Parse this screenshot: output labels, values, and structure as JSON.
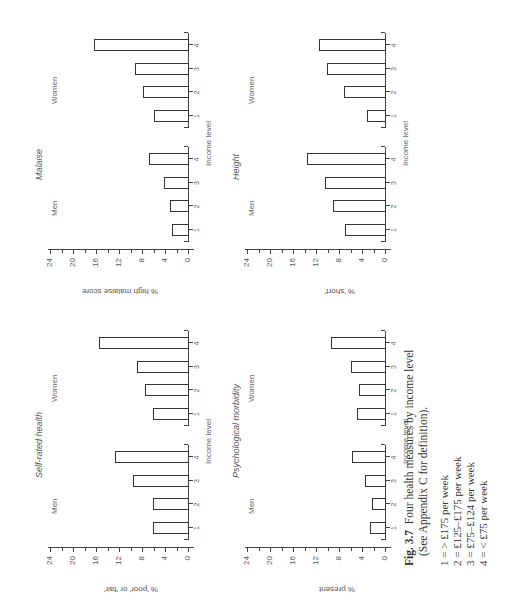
{
  "figure": {
    "label": "Fig. 3.7",
    "title": "Four health measures by income level",
    "subtitle": "(See Appendix C for definition).",
    "legend": [
      "1 = > £175 per week",
      "2 = £125–£175 per week",
      "3 = £75–£124 per week",
      "4 = < £75 per week"
    ]
  },
  "axis": {
    "ticks": [
      "0",
      "4",
      "8",
      "12",
      "16",
      "20",
      "24"
    ],
    "categories": [
      "1",
      "2",
      "3",
      "4"
    ],
    "xlabel": "Income level",
    "men_label": "Men",
    "women_label": "Women"
  },
  "panels": {
    "self_rated": {
      "title": "Self-rated health",
      "ylabel": "% 'poor' or 'fair'"
    },
    "malaise": {
      "title": "Malaise",
      "ylabel": "% high malaise score"
    },
    "psych": {
      "title": "Psychological morbidity",
      "ylabel": "% present"
    },
    "height": {
      "title": "Height",
      "ylabel": "% 'short'"
    }
  },
  "chart_data": [
    {
      "type": "bar",
      "title": "Self-rated health",
      "xlabel": "Income level",
      "ylabel": "% 'poor' or 'fair'",
      "ylim": [
        0,
        24
      ],
      "categories": [
        "1",
        "2",
        "3",
        "4"
      ],
      "series": [
        {
          "name": "Men",
          "values": [
            6.1,
            6.1,
            9.5,
            12.7
          ]
        },
        {
          "name": "Women",
          "values": [
            6.1,
            7.5,
            8.9,
            15.4
          ]
        }
      ]
    },
    {
      "type": "bar",
      "title": "Malaise",
      "xlabel": "Income level",
      "ylabel": "% high malaise score",
      "ylim": [
        0,
        24
      ],
      "categories": [
        "1",
        "2",
        "3",
        "4"
      ],
      "series": [
        {
          "name": "Men",
          "values": [
            2.8,
            3.2,
            4.1,
            6.7
          ]
        },
        {
          "name": "Women",
          "values": [
            6.0,
            7.9,
            9.2,
            16.4
          ]
        }
      ]
    },
    {
      "type": "bar",
      "title": "Psychological morbidity",
      "xlabel": "Income level",
      "ylabel": "% present",
      "ylim": [
        0,
        24
      ],
      "categories": [
        "1",
        "2",
        "3",
        "4"
      ],
      "series": [
        {
          "name": "Men",
          "values": [
            2.6,
            2.2,
            3.4,
            5.8
          ]
        },
        {
          "name": "Women",
          "values": [
            4.8,
            4.6,
            6.0,
            9.4
          ]
        }
      ]
    },
    {
      "type": "bar",
      "title": "Height",
      "xlabel": "Income level",
      "ylabel": "% 'short'",
      "ylim": [
        0,
        24
      ],
      "categories": [
        "1",
        "2",
        "3",
        "4"
      ],
      "series": [
        {
          "name": "Men",
          "values": [
            6.9,
            9.1,
            10.5,
            13.5
          ]
        },
        {
          "name": "Women",
          "values": [
            3.2,
            7.1,
            10.1,
            11.5
          ]
        }
      ]
    }
  ]
}
